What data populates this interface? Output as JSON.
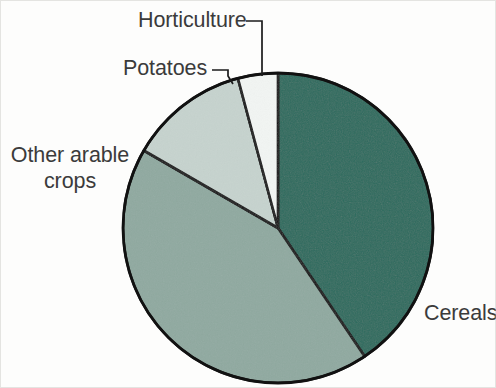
{
  "figure": {
    "name": "agricultural-land-use-pie-chart",
    "background_color": "#fdfdfc"
  },
  "labels": {
    "horticulture": "Horticulture",
    "potatoes": "Potatoes",
    "other_arable_line1": "Other arable",
    "other_arable_line2": "crops",
    "cereals": "Cereals"
  },
  "chart_data": {
    "type": "pie",
    "title": "",
    "subtitle": "",
    "xlabel": "",
    "ylabel": "",
    "legend_position": "none",
    "labels_position": "callout",
    "grid": false,
    "start_angle_deg": 0,
    "direction": "clockwise",
    "categories": [
      "Cereals",
      "Other arable crops",
      "Potatoes",
      "Horticulture"
    ],
    "values": [
      40.5,
      42.8,
      12.5,
      4.2
    ],
    "value_unit": "percent",
    "slices": [
      {
        "name": "Cereals",
        "value": 40.5,
        "start_angle_deg": 0,
        "end_angle_deg": 146,
        "color": "#2c6b5e",
        "outline_color": "#111111"
      },
      {
        "name": "Other arable crops",
        "value": 42.8,
        "start_angle_deg": 146,
        "end_angle_deg": 300,
        "color": "#8fa9a0",
        "outline_color": "#111111"
      },
      {
        "name": "Potatoes",
        "value": 12.5,
        "start_angle_deg": 300,
        "end_angle_deg": 345,
        "color": "#c6d3ce",
        "outline_color": "#111111"
      },
      {
        "name": "Horticulture",
        "value": 4.2,
        "start_angle_deg": 345,
        "end_angle_deg": 360,
        "color": "#f2f5f3",
        "outline_color": "#111111"
      }
    ],
    "geometry": {
      "center_x": 278,
      "center_y": 228,
      "radius": 155,
      "clipped_at_bottom": true
    },
    "colors": {
      "cereals": "#2c6b5e",
      "other_arable_crops": "#8fa9a0",
      "potatoes": "#c6d3ce",
      "horticulture": "#f2f5f3",
      "outline": "#111111",
      "text": "#3b3b3b",
      "background": "#fdfdfc"
    }
  }
}
